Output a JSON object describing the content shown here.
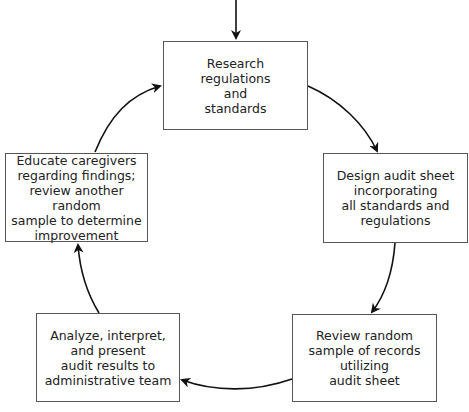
{
  "diagram": {
    "type": "cycle-flowchart",
    "steps": [
      {
        "id": "research",
        "text": "Research\nregulations\nand\nstandards"
      },
      {
        "id": "design",
        "text": "Design audit sheet\nincorporating\nall standards and\nregulations"
      },
      {
        "id": "review",
        "text": "Review random\nsample of records\nutilizing\naudit sheet"
      },
      {
        "id": "analyze",
        "text": "Analyze, interpret,\nand present\naudit results to\nadministrative team"
      },
      {
        "id": "educate",
        "text": "Educate caregivers\nregarding findings;\nreview another random\nsample to determine\nimprovement"
      }
    ],
    "flow": [
      "entry -> research",
      "research -> design",
      "design -> review",
      "review -> analyze",
      "analyze -> educate",
      "educate -> research"
    ]
  }
}
